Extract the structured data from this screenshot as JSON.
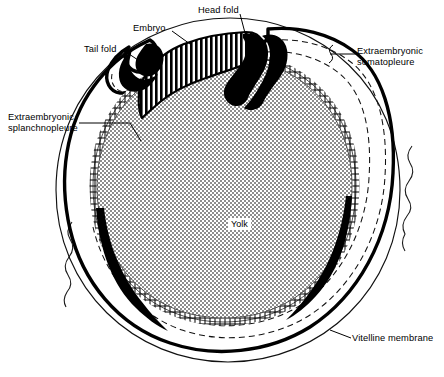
{
  "figure": {
    "type": "anatomical-diagram"
  },
  "labels": {
    "head_fold": "Head fold",
    "embryo": "Embryo",
    "tail_fold": "Tail fold",
    "extraembryonic_somatopleure": "Extraembryonic\nsomatopleure",
    "extraembryonic_splanchnopleure": "Extraembryonic\nsplanchnopleure",
    "vitelline_membrane": "Vitelline membrane",
    "yolk": "Yolk"
  },
  "structures": [
    {
      "name": "yolk-mass",
      "fill": "stipple-checker",
      "tone": "#b5b5b5"
    },
    {
      "name": "extraembryonic-splanchnopleure-band",
      "fill": "ladder-hatch"
    },
    {
      "name": "embryo-band",
      "fill": "vertical-hatch"
    },
    {
      "name": "head-fold",
      "fill": "solid-black"
    },
    {
      "name": "tail-fold",
      "fill": "solid-black"
    },
    {
      "name": "extraembryonic-somatopleure",
      "fill": "dashed-outline"
    },
    {
      "name": "vitelline-membrane",
      "fill": "thin-outline"
    },
    {
      "name": "albumen-edge",
      "fill": "wavy-line"
    }
  ],
  "colors": {
    "ink": "#000000",
    "paper": "#ffffff",
    "yolk_tone": "#b5b5b5",
    "yolk_dark": "#6f6f6f"
  }
}
